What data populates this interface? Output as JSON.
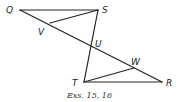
{
  "figure": {
    "caption": "Exs. 15, 16",
    "points": [
      {
        "name": "Q",
        "x": 20,
        "y": 10,
        "label_x": 6,
        "label_y": 13
      },
      {
        "name": "S",
        "x": 98,
        "y": 10,
        "label_x": 102,
        "label_y": 13
      },
      {
        "name": "V",
        "x": 50,
        "y": 23,
        "label_x": 38,
        "label_y": 35
      },
      {
        "name": "U",
        "x": 91,
        "y": 48,
        "label_x": 95,
        "label_y": 47
      },
      {
        "name": "T",
        "x": 84,
        "y": 82,
        "label_x": 72,
        "label_y": 86
      },
      {
        "name": "W",
        "x": 134,
        "y": 68,
        "label_x": 131,
        "label_y": 65
      },
      {
        "name": "R",
        "x": 162,
        "y": 82,
        "label_x": 166,
        "label_y": 86
      }
    ],
    "segments": [
      {
        "from": "Q",
        "to": "S"
      },
      {
        "from": "Q",
        "to": "R"
      },
      {
        "from": "S",
        "to": "V"
      },
      {
        "from": "S",
        "to": "T"
      },
      {
        "from": "T",
        "to": "R"
      },
      {
        "from": "T",
        "to": "W"
      }
    ]
  }
}
